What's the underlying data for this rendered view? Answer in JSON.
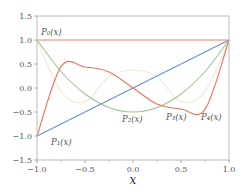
{
  "chart_data": {
    "type": "line",
    "title": "",
    "xlabel": "x",
    "ylabel": "",
    "xlim": [
      -1.0,
      1.0
    ],
    "ylim": [
      -1.5,
      1.5
    ],
    "grid": false,
    "legend": "none (inline curve labels)",
    "x_ticks": [
      "−1.0",
      "−0.5",
      "0.0",
      "0.5",
      "1.0"
    ],
    "x_tick_values": [
      -1.0,
      -0.5,
      0.0,
      0.5,
      1.0
    ],
    "x_minor_ticks": [
      -0.75,
      -0.25,
      0.25,
      0.75
    ],
    "y_ticks": [
      "1.5",
      "1.0",
      "0.5",
      "0.0",
      "−0.5",
      "−1.0",
      "−1.5"
    ],
    "y_tick_values": [
      1.5,
      1.0,
      0.5,
      0.0,
      -0.5,
      -1.0,
      -1.5
    ],
    "x": [
      -1.0,
      -0.75,
      -0.5,
      -0.25,
      0.0,
      0.25,
      0.5,
      0.75,
      1.0
    ],
    "series": [
      {
        "name": "P0(x)",
        "label": "P₀(x)",
        "color": "#E8836A",
        "values": [
          1,
          1,
          1,
          1,
          1,
          1,
          1,
          1,
          1
        ],
        "label_pos": [
          41,
          35
        ]
      },
      {
        "name": "P1(x)",
        "label": "P₁(x)",
        "color": "#6C8FD6",
        "values": [
          -1.0,
          -0.75,
          -0.5,
          -0.25,
          0.0,
          0.25,
          0.5,
          0.75,
          1.0
        ],
        "label_pos": [
          51,
          145
        ]
      },
      {
        "name": "P2(x)",
        "label": "P₂(x)",
        "color": "#9DC48E",
        "values": [
          1.0,
          0.34375,
          -0.125,
          -0.40625,
          -0.5,
          -0.40625,
          -0.125,
          0.34375,
          1.0
        ],
        "label_pos": [
          122,
          122
        ]
      },
      {
        "name": "P3(x)",
        "label": "P₃(x)",
        "color": "#E8745C",
        "values": [
          -1.0,
          0.4453,
          0.4375,
          0.3359,
          0.0,
          -0.3359,
          -0.4375,
          -0.4453,
          1.0
        ],
        "label_pos": [
          166,
          120
        ]
      },
      {
        "name": "P4(x)",
        "label": "P₄(x)",
        "color": "#F4EAD8",
        "values": [
          1.0,
          -0.0732,
          -0.2891,
          0.2334,
          0.375,
          0.2334,
          -0.2891,
          -0.0732,
          1.0
        ],
        "label_pos": [
          201,
          120
        ]
      }
    ]
  }
}
